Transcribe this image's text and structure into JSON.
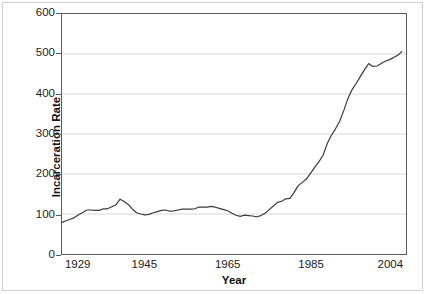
{
  "chart_data": {
    "type": "line",
    "title": "",
    "xlabel": "Year",
    "ylabel": "Incarceration Rate",
    "xlim": [
      1925,
      2008
    ],
    "ylim": [
      0,
      600
    ],
    "ytick_values": [
      0,
      100,
      200,
      300,
      400,
      500,
      600
    ],
    "ytick_labels": [
      "0",
      "100",
      "200",
      "300",
      "400",
      "500",
      "600"
    ],
    "xtick_values": [
      1929,
      1945,
      1965,
      1985,
      2004
    ],
    "xtick_labels": [
      "1929",
      "1945",
      "1965",
      "1985",
      "2004"
    ],
    "grid": "horizontal",
    "legend": "none",
    "series": [
      {
        "name": "Incarceration Rate",
        "color": "#3a3a3a",
        "x": [
          1925,
          1926,
          1927,
          1928,
          1929,
          1930,
          1931,
          1932,
          1933,
          1934,
          1935,
          1936,
          1937,
          1938,
          1939,
          1940,
          1941,
          1942,
          1943,
          1944,
          1945,
          1946,
          1947,
          1948,
          1949,
          1950,
          1951,
          1952,
          1953,
          1954,
          1955,
          1956,
          1957,
          1958,
          1959,
          1960,
          1961,
          1962,
          1963,
          1964,
          1965,
          1966,
          1967,
          1968,
          1969,
          1970,
          1971,
          1972,
          1973,
          1974,
          1975,
          1976,
          1977,
          1978,
          1979,
          1980,
          1981,
          1982,
          1983,
          1984,
          1985,
          1986,
          1987,
          1988,
          1989,
          1990,
          1991,
          1992,
          1993,
          1994,
          1995,
          1996,
          1997,
          1998,
          1999,
          2000,
          2001,
          2002,
          2003,
          2004,
          2005,
          2006,
          2007
        ],
        "values": [
          79,
          83,
          87,
          91,
          98,
          104,
          110,
          110,
          109,
          109,
          113,
          113,
          118,
          123,
          137,
          131,
          124,
          112,
          103,
          100,
          98,
          99,
          103,
          106,
          109,
          110,
          107,
          108,
          110,
          112,
          112,
          112,
          113,
          117,
          117,
          117,
          119,
          117,
          114,
          111,
          108,
          102,
          97,
          94,
          97,
          96,
          95,
          93,
          96,
          102,
          111,
          120,
          129,
          132,
          138,
          139,
          154,
          171,
          179,
          188,
          202,
          217,
          231,
          247,
          276,
          297,
          313,
          332,
          359,
          389,
          411,
          427,
          444,
          461,
          476,
          469,
          470,
          476,
          482,
          486,
          491,
          497,
          506
        ]
      }
    ]
  },
  "axes": {
    "y_title": "Incarceration Rate",
    "x_title": "Year"
  }
}
